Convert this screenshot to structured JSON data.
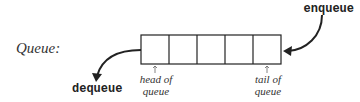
{
  "diagram": {
    "title_label": "Queue:",
    "cells": 5,
    "enqueue_label": "enqueue",
    "dequeue_label": "dequeue",
    "head_label_line1": "head of",
    "head_label_line2": "queue",
    "tail_label_line1": "tail of",
    "tail_label_line2": "queue",
    "colors": {
      "line": "#222222",
      "label": "#333333"
    }
  }
}
